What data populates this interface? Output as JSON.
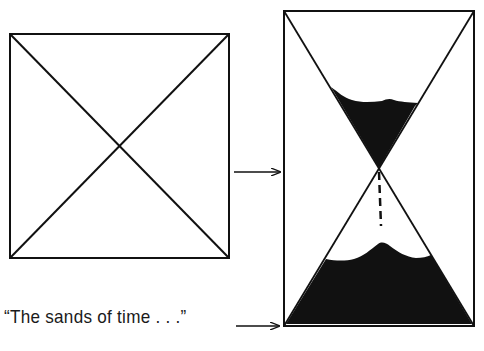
{
  "diagram": {
    "caption": "“The sands of time . . .”",
    "colors": {
      "ink": "#111111",
      "background": "#ffffff"
    },
    "figures": [
      {
        "id": "square-with-diagonals",
        "description": "Square with both diagonals drawn, forming an X",
        "box": {
          "x1": 10,
          "y1": 34,
          "x2": 229,
          "y2": 258
        }
      },
      {
        "id": "hourglass-rectangle",
        "description": "Tall rectangle with diagonals, interpreted as an hourglass with sand falling",
        "box": {
          "x1": 284,
          "y1": 11,
          "x2": 474,
          "y2": 326
        }
      }
    ],
    "arrows": [
      {
        "id": "arrow-square-to-hourglass",
        "from": [
          234,
          172
        ],
        "to": [
          280,
          172
        ]
      },
      {
        "id": "arrow-caption-to-hourglass",
        "from": [
          236,
          326
        ],
        "to": [
          280,
          326
        ]
      }
    ]
  }
}
